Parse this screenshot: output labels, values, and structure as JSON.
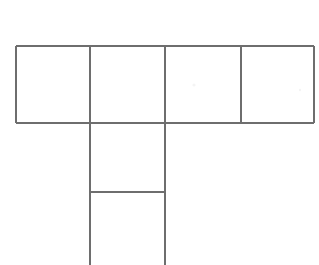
{
  "figure": {
    "description": "Line drawing of a net made of six squares: a horizontal row of four squares with two additional squares extending downward from the second square of the row.",
    "background_color": "#ffffff",
    "line_color": "#6e6e6e",
    "line_width": 2,
    "canvas": {
      "width": 319,
      "height": 265
    },
    "geometry": {
      "row_top_y": 46,
      "row_bottom_y": 123,
      "row_left_x": 16,
      "row_right_x": 314,
      "column_left_x": 90,
      "column_right_x": 165,
      "column_mid_y": 192,
      "column_bottom_y": 265,
      "vertical_dividers_x": [
        90,
        165,
        241
      ],
      "squares_in_row": 4,
      "squares_in_column": 2,
      "total_squares": 6
    },
    "faces": [
      {
        "id": "row-square-1",
        "x": 16,
        "y": 46,
        "width": 74,
        "height": 77
      },
      {
        "id": "row-square-2",
        "x": 90,
        "y": 46,
        "width": 75,
        "height": 77
      },
      {
        "id": "row-square-3",
        "x": 165,
        "y": 46,
        "width": 76,
        "height": 77
      },
      {
        "id": "row-square-4",
        "x": 241,
        "y": 46,
        "width": 73,
        "height": 77
      },
      {
        "id": "column-square-1",
        "x": 90,
        "y": 123,
        "width": 75,
        "height": 69
      },
      {
        "id": "column-square-2",
        "x": 90,
        "y": 192,
        "width": 75,
        "height": 73
      }
    ],
    "segments": [
      {
        "id": "row-top-edge",
        "orientation": "horizontal",
        "x1": 16,
        "y1": 46,
        "x2": 314,
        "y2": 46
      },
      {
        "id": "row-bottom-edge",
        "orientation": "horizontal",
        "x1": 16,
        "y1": 123,
        "x2": 314,
        "y2": 123
      },
      {
        "id": "row-left-edge",
        "orientation": "vertical",
        "x1": 16,
        "y1": 46,
        "x2": 16,
        "y2": 123
      },
      {
        "id": "row-right-edge",
        "orientation": "vertical",
        "x1": 314,
        "y1": 46,
        "x2": 314,
        "y2": 123
      },
      {
        "id": "row-divider-1",
        "orientation": "vertical",
        "x1": 90,
        "y1": 46,
        "x2": 90,
        "y2": 123
      },
      {
        "id": "row-divider-2",
        "orientation": "vertical",
        "x1": 165,
        "y1": 46,
        "x2": 165,
        "y2": 123
      },
      {
        "id": "row-divider-3",
        "orientation": "vertical",
        "x1": 241,
        "y1": 46,
        "x2": 241,
        "y2": 123
      },
      {
        "id": "column-left-edge",
        "orientation": "vertical",
        "x1": 90,
        "y1": 123,
        "x2": 90,
        "y2": 265
      },
      {
        "id": "column-right-edge",
        "orientation": "vertical",
        "x1": 165,
        "y1": 123,
        "x2": 165,
        "y2": 265
      },
      {
        "id": "column-divider",
        "orientation": "horizontal",
        "x1": 90,
        "y1": 192,
        "x2": 165,
        "y2": 192
      }
    ],
    "artifacts": [
      {
        "id": "speck-1",
        "x": 194,
        "y": 85,
        "r": 1.6
      },
      {
        "id": "speck-2",
        "x": 300,
        "y": 90,
        "r": 1.2
      }
    ],
    "labels": {
      "has_text": false,
      "text_items": []
    }
  }
}
